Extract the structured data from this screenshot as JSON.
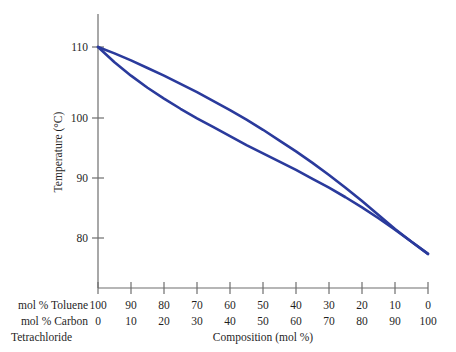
{
  "chart_data": {
    "type": "line",
    "title": "",
    "xlabel": "Composition (mol %)",
    "ylabel": "Temperature (°C)",
    "x_axis_rows": [
      {
        "name": "mol % Toluene",
        "label": "mol % Toluene",
        "ticks": [
          "100",
          "90",
          "80",
          "70",
          "60",
          "50",
          "40",
          "30",
          "20",
          "10",
          "0"
        ]
      },
      {
        "name": "mol % Carbon Tetrachloride",
        "label_line1": "mol % Carbon",
        "label_line2": "Tetrachloride",
        "ticks": [
          "0",
          "10",
          "20",
          "30",
          "40",
          "50",
          "60",
          "70",
          "80",
          "90",
          "100"
        ]
      }
    ],
    "ytick_labels": [
      "110",
      "100",
      "90",
      "80"
    ],
    "ytick_values": [
      110,
      100,
      90,
      80
    ],
    "ylim": [
      74.5,
      112.5
    ],
    "xlim": [
      0,
      100
    ],
    "grid": false,
    "legend": null,
    "curve_color": "#2a3a9c",
    "axis_color": "#6e6e6e",
    "series": [
      {
        "name": "vapor-curve",
        "x": [
          0,
          5,
          10,
          15,
          20,
          25,
          30,
          35,
          40,
          45,
          50,
          55,
          60,
          65,
          70,
          75,
          80,
          85,
          90,
          95,
          100
        ],
        "y": [
          110.0,
          109.0,
          107.9,
          106.7,
          105.5,
          104.2,
          102.9,
          101.5,
          100.1,
          98.6,
          97.0,
          95.3,
          93.6,
          91.8,
          89.9,
          87.9,
          85.8,
          83.6,
          81.4,
          79.4,
          77.5
        ]
      },
      {
        "name": "liquid-curve",
        "x": [
          0,
          5,
          10,
          15,
          20,
          25,
          30,
          35,
          40,
          45,
          50,
          55,
          60,
          65,
          70,
          75,
          80,
          85,
          90,
          95,
          100
        ],
        "y": [
          110.0,
          107.6,
          105.5,
          103.6,
          101.9,
          100.3,
          98.8,
          97.4,
          96.0,
          94.6,
          93.3,
          92.0,
          90.7,
          89.3,
          87.9,
          86.4,
          84.8,
          83.1,
          81.3,
          79.4,
          77.5
        ]
      }
    ],
    "annotations": []
  }
}
